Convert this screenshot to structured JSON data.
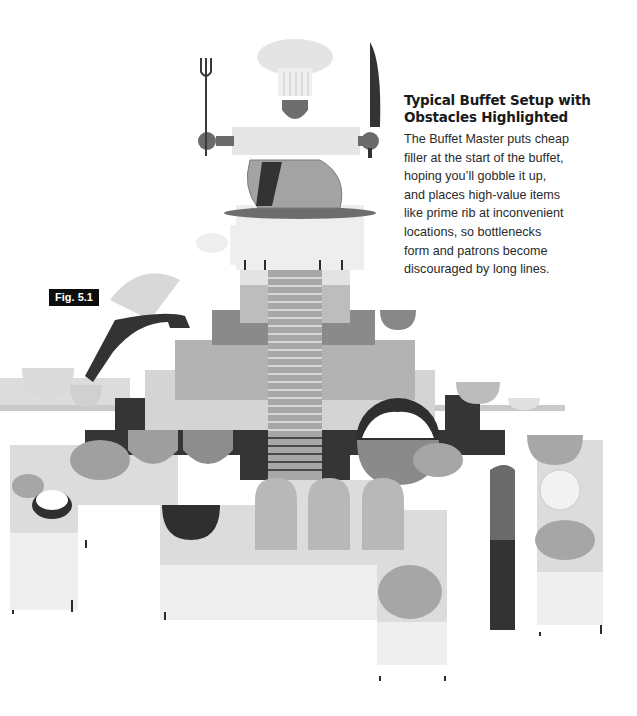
{
  "caption": {
    "title_line1": "Typical Buffet Setup with",
    "title_line2": "Obstacles Highlighted",
    "body_lines": [
      "The Buffet Master puts cheap",
      "filler at the start of the buffet,",
      "hoping you’ll gobble it up,",
      "and places high-value items",
      "like prime rib at inconvenient",
      "locations, so bottlenecks",
      "form and patrons become",
      "discouraged by long lines."
    ]
  },
  "figure_label": "Fig. 5.1",
  "illustration": {
    "subject": "buffet-tables-with-chef-carving-prime-rib",
    "palette": {
      "darkest": "#2e2e2e",
      "dark": "#5e5e5e",
      "mid": "#8c8c8c",
      "light": "#b9b9b9",
      "lighter": "#d7d7d7",
      "lightest": "#ececec",
      "paper": "#ffffff"
    }
  }
}
